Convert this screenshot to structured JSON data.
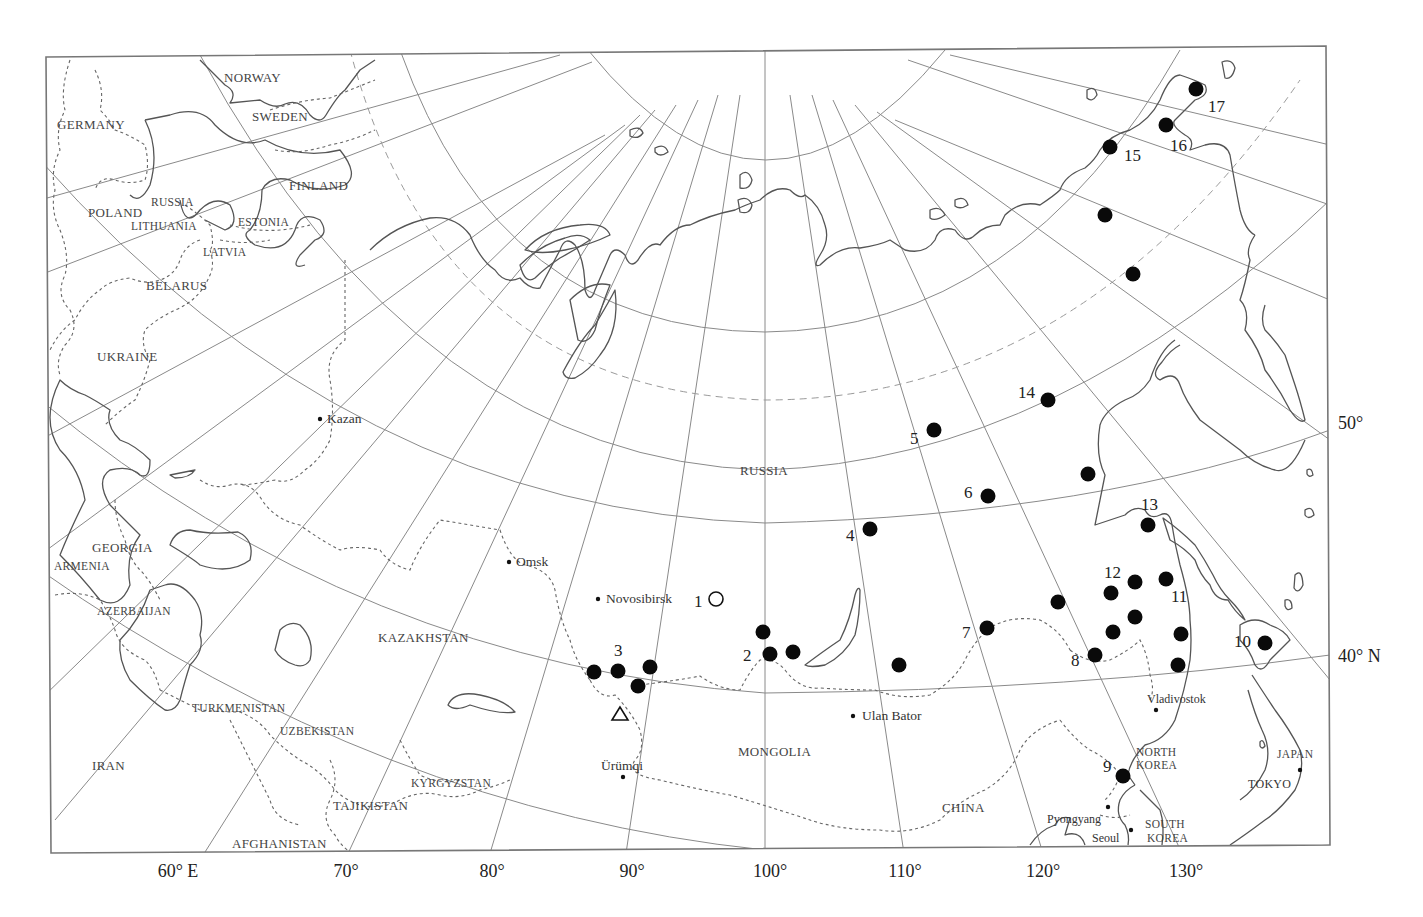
{
  "map": {
    "projection": "oblique conic / azimuthal graticule",
    "colors": {
      "land_outline": "#555555",
      "graticule": "#8a8a8a",
      "marker": "#0a0a0a",
      "background": "#ffffff"
    },
    "longitude_labels": [
      {
        "text": "60° E",
        "x": 178
      },
      {
        "text": "70°",
        "x": 346
      },
      {
        "text": "80°",
        "x": 492
      },
      {
        "text": "90°",
        "x": 632
      },
      {
        "text": "100°",
        "x": 770
      },
      {
        "text": "110°",
        "x": 905
      },
      {
        "text": "120°",
        "x": 1043
      },
      {
        "text": "130°",
        "x": 1186
      }
    ],
    "latitude_labels": [
      {
        "text": "50°",
        "y": 429
      },
      {
        "text": "40° N",
        "y": 662
      }
    ],
    "countries": [
      {
        "name": "NORWAY",
        "x": 224,
        "y": 82
      },
      {
        "name": "GERMANY",
        "x": 57,
        "y": 129
      },
      {
        "name": "SWEDEN",
        "x": 252,
        "y": 121
      },
      {
        "name": "FINLAND",
        "x": 289,
        "y": 190
      },
      {
        "name": "POLAND",
        "x": 88,
        "y": 217
      },
      {
        "name": "RUSSIA",
        "x": 151,
        "y": 206,
        "small": true
      },
      {
        "name": "LITHUANIA",
        "x": 131,
        "y": 230,
        "small": true
      },
      {
        "name": "ESTONIA",
        "x": 238,
        "y": 226,
        "small": true
      },
      {
        "name": "LATVIA",
        "x": 203,
        "y": 256,
        "small": true
      },
      {
        "name": "BELARUS",
        "x": 146,
        "y": 290
      },
      {
        "name": "UKRAINE",
        "x": 97,
        "y": 361
      },
      {
        "name": "RUSSIA",
        "x": 740,
        "y": 475
      },
      {
        "name": "GEORGIA",
        "x": 92,
        "y": 552
      },
      {
        "name": "ARMENIA",
        "x": 54,
        "y": 570,
        "small": true
      },
      {
        "name": "AZERBAIJAN",
        "x": 97,
        "y": 615,
        "small": true
      },
      {
        "name": "KAZAKHSTAN",
        "x": 378,
        "y": 642
      },
      {
        "name": "TURKMENISTAN",
        "x": 192,
        "y": 712,
        "small": true
      },
      {
        "name": "UZBEKISTAN",
        "x": 280,
        "y": 735,
        "small": true
      },
      {
        "name": "IRAN",
        "x": 92,
        "y": 770
      },
      {
        "name": "KYRGYZSTAN",
        "x": 411,
        "y": 787,
        "small": true
      },
      {
        "name": "TAJIKISTAN",
        "x": 333,
        "y": 810
      },
      {
        "name": "AFGHANISTAN",
        "x": 232,
        "y": 848
      },
      {
        "name": "MONGOLIA",
        "x": 738,
        "y": 756
      },
      {
        "name": "CHINA",
        "x": 942,
        "y": 812
      },
      {
        "name": "NORTH",
        "x": 1136,
        "y": 756,
        "small": true
      },
      {
        "name": "KOREA",
        "x": 1136,
        "y": 769,
        "small": true
      },
      {
        "name": "SOUTH",
        "x": 1145,
        "y": 828,
        "small": true
      },
      {
        "name": "KOREA",
        "x": 1147,
        "y": 842,
        "small": true
      },
      {
        "name": "JAPAN",
        "x": 1277,
        "y": 758,
        "small": true
      }
    ],
    "cities": [
      {
        "name": "Kazan",
        "x": 320,
        "y": 419,
        "label_dx": 7
      },
      {
        "name": "Omsk",
        "x": 509,
        "y": 562,
        "label_dx": 7
      },
      {
        "name": "Novosibirsk",
        "x": 598,
        "y": 599,
        "label_dx": 8
      },
      {
        "name": "Ulan Bator",
        "x": 853,
        "y": 716,
        "label_dx": 9
      },
      {
        "name": "Ürümqi",
        "x": 623,
        "y": 777,
        "label_dx": -22,
        "label_dy": -7
      },
      {
        "name": "Vladivostok",
        "x": 1156,
        "y": 710,
        "label_dx": -9,
        "label_dy": -7
      },
      {
        "name": "Pyongyang",
        "x": 1108,
        "y": 807,
        "label_dx": -61,
        "label_dy": 16
      },
      {
        "name": "Seoul",
        "x": 1131,
        "y": 830,
        "label_dx": -39,
        "label_dy": 12
      },
      {
        "name": "TOKYO",
        "x": 1300,
        "y": 770,
        "label_dx": -52,
        "label_dy": 18
      }
    ],
    "sites": [
      {
        "id": "1",
        "type": "open-circle",
        "x": 716,
        "y": 599,
        "label_x": 694,
        "label_y": 607
      },
      {
        "id": "2",
        "type": "filled",
        "x": 770,
        "y": 654,
        "label_x": 743,
        "label_y": 661
      },
      {
        "id": "",
        "type": "filled",
        "x": 763,
        "y": 632
      },
      {
        "id": "",
        "type": "filled",
        "x": 793,
        "y": 652
      },
      {
        "id": "3",
        "type": "filled",
        "x": 618,
        "y": 671,
        "label_x": 614,
        "label_y": 656
      },
      {
        "id": "",
        "type": "filled",
        "x": 594,
        "y": 672
      },
      {
        "id": "",
        "type": "filled",
        "x": 650,
        "y": 667
      },
      {
        "id": "",
        "type": "filled",
        "x": 638,
        "y": 686
      },
      {
        "id": "",
        "type": "filled",
        "x": 899,
        "y": 665
      },
      {
        "id": "4",
        "type": "filled",
        "x": 870,
        "y": 529,
        "label_x": 846,
        "label_y": 541
      },
      {
        "id": "5",
        "type": "filled",
        "x": 934,
        "y": 430,
        "label_x": 910,
        "label_y": 444
      },
      {
        "id": "6",
        "type": "filled",
        "x": 988,
        "y": 496,
        "label_x": 964,
        "label_y": 498
      },
      {
        "id": "7",
        "type": "filled",
        "x": 987,
        "y": 628,
        "label_x": 962,
        "label_y": 638
      },
      {
        "id": "",
        "type": "filled",
        "x": 1058,
        "y": 602
      },
      {
        "id": "8",
        "type": "filled",
        "x": 1095,
        "y": 655,
        "label_x": 1071,
        "label_y": 666
      },
      {
        "id": "",
        "type": "filled",
        "x": 1113,
        "y": 632
      },
      {
        "id": "",
        "type": "filled",
        "x": 1135,
        "y": 617
      },
      {
        "id": "",
        "type": "filled",
        "x": 1181,
        "y": 634
      },
      {
        "id": "",
        "type": "filled",
        "x": 1178,
        "y": 665
      },
      {
        "id": "9",
        "type": "filled",
        "x": 1123,
        "y": 776,
        "label_x": 1103,
        "label_y": 772
      },
      {
        "id": "10",
        "type": "filled",
        "x": 1265,
        "y": 643,
        "label_x": 1234,
        "label_y": 647
      },
      {
        "id": "11",
        "type": "filled",
        "x": 1166,
        "y": 579,
        "label_x": 1171,
        "label_y": 602
      },
      {
        "id": "12",
        "type": "filled",
        "x": 1135,
        "y": 582,
        "label_x": 1104,
        "label_y": 578
      },
      {
        "id": "",
        "type": "filled",
        "x": 1111,
        "y": 593
      },
      {
        "id": "13",
        "type": "filled",
        "x": 1148,
        "y": 525,
        "label_x": 1141,
        "label_y": 510
      },
      {
        "id": "",
        "type": "filled",
        "x": 1088,
        "y": 474
      },
      {
        "id": "14",
        "type": "filled",
        "x": 1048,
        "y": 400,
        "label_x": 1018,
        "label_y": 398
      },
      {
        "id": "",
        "type": "filled",
        "x": 1133,
        "y": 274
      },
      {
        "id": "",
        "type": "filled",
        "x": 1105,
        "y": 215
      },
      {
        "id": "15",
        "type": "filled",
        "x": 1110,
        "y": 147,
        "label_x": 1124,
        "label_y": 161
      },
      {
        "id": "16",
        "type": "filled",
        "x": 1166,
        "y": 125,
        "label_x": 1170,
        "label_y": 151
      },
      {
        "id": "17",
        "type": "filled",
        "x": 1196,
        "y": 89,
        "label_x": 1208,
        "label_y": 112
      }
    ],
    "triangle_marker": {
      "x": 620,
      "y": 714
    }
  }
}
